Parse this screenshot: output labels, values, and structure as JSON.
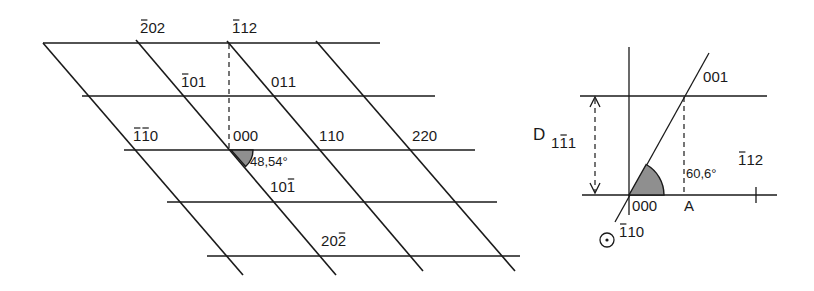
{
  "left_lattice": {
    "title": "Reciprocal lattice section",
    "angle_label": "48,54°",
    "nodes": [
      {
        "id": "bar2-0-2",
        "digits": [
          "2",
          "0",
          "2"
        ],
        "bars": [
          0
        ],
        "x": 140,
        "y": 33
      },
      {
        "id": "bar1-1-2",
        "digits": [
          "1",
          "1",
          "2"
        ],
        "bars": [
          0
        ],
        "x": 232,
        "y": 33
      },
      {
        "id": "bar1-0-1",
        "digits": [
          "1",
          "0",
          "1"
        ],
        "bars": [
          0
        ],
        "x": 181,
        "y": 87
      },
      {
        "id": "0-1-1",
        "digits": [
          "0",
          "1",
          "1"
        ],
        "bars": [],
        "x": 271,
        "y": 87
      },
      {
        "id": "bar1-bar1-0",
        "digits": [
          "1",
          "1",
          "0"
        ],
        "bars": [
          0,
          1
        ],
        "x": 133,
        "y": 141
      },
      {
        "id": "0-0-0",
        "digits": [
          "0",
          "0",
          "0"
        ],
        "bars": [],
        "x": 233,
        "y": 141
      },
      {
        "id": "1-1-0",
        "digits": [
          "1",
          "1",
          "0"
        ],
        "bars": [],
        "x": 319,
        "y": 141
      },
      {
        "id": "2-2-0",
        "digits": [
          "2",
          "2",
          "0"
        ],
        "bars": [],
        "x": 412,
        "y": 141
      },
      {
        "id": "1-0-bar1",
        "digits": [
          "1",
          "0",
          "1"
        ],
        "bars": [
          2
        ],
        "x": 270,
        "y": 192
      },
      {
        "id": "2-0-bar2",
        "digits": [
          "2",
          "0",
          "2"
        ],
        "bars": [
          2
        ],
        "x": 321,
        "y": 246
      }
    ]
  },
  "right_diagram": {
    "spacing_label": "D",
    "spacing_subscript": {
      "digits": [
        "1",
        "1",
        "1"
      ],
      "bars": [
        1
      ]
    },
    "direction_top": {
      "digits": [
        "0",
        "0",
        "1"
      ],
      "bars": []
    },
    "direction_right": {
      "digits": [
        "1",
        "1",
        "2"
      ],
      "bars": [
        0
      ]
    },
    "origin": {
      "digits": [
        "0",
        "0",
        "0"
      ],
      "bars": []
    },
    "zone_axis": {
      "digits": [
        "1",
        "1",
        "0"
      ],
      "bars": [
        0
      ]
    },
    "point_label": "A",
    "angle_label": "60,6°",
    "zone_axis_symbol": "dot-in-circle"
  }
}
